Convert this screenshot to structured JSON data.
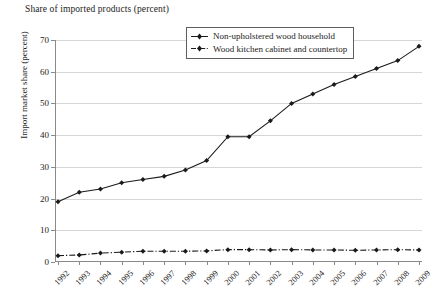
{
  "chart_data": {
    "type": "line",
    "title": "Share of imported products (percent)",
    "xlabel": "",
    "ylabel": "Import market share (percent)",
    "ylim": [
      0,
      70
    ],
    "ytick_step": 10,
    "yticks": [
      0,
      10,
      20,
      30,
      40,
      50,
      60,
      70
    ],
    "grid": true,
    "legend_position": "top-right",
    "categories": [
      "1992",
      "1993",
      "1994",
      "1995",
      "1996",
      "1997",
      "1998",
      "1999",
      "2000",
      "2001",
      "2002",
      "2003",
      "2004",
      "2005",
      "2006",
      "2007",
      "2008",
      "2009"
    ],
    "series": [
      {
        "name": "Non-upholstered wood household",
        "marker": "filled-diamond",
        "line_style": "solid",
        "color": "#1a1a1a",
        "values": [
          19,
          22,
          23,
          25,
          26,
          27,
          29,
          32,
          39.5,
          39.5,
          44.5,
          50,
          53,
          56,
          58.5,
          61,
          63.5,
          68
        ]
      },
      {
        "name": "Wood kitchen cabinet and countertop",
        "marker": "filled-diamond",
        "line_style": "dash-dot",
        "color": "#1a1a1a",
        "values": [
          2,
          2.2,
          2.8,
          3.1,
          3.4,
          3.4,
          3.4,
          3.5,
          3.9,
          3.9,
          3.8,
          3.9,
          3.8,
          3.8,
          3.7,
          3.8,
          3.9,
          3.8
        ]
      }
    ]
  },
  "legend": {
    "entries": [
      {
        "label": "Non-upholstered wood household"
      },
      {
        "label": "Wood kitchen cabinet and countertop"
      }
    ]
  }
}
